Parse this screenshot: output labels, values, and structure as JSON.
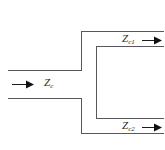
{
  "figure": {
    "background_color": "#ffffff",
    "wall_color": "#58585c",
    "arrow_color": "#111111",
    "label_color": "#2b2b2b"
  },
  "labels": {
    "input_impedance": {
      "symbol": "Z",
      "subscript": "c",
      "full": "Zc",
      "name": "input-characteristic-impedance"
    },
    "output_impedance_top": {
      "symbol": "Z",
      "subscript": "c1",
      "full": "Zc1",
      "name": "upper-branch-characteristic-impedance"
    },
    "output_impedance_bottom": {
      "symbol": "Z",
      "subscript": "c2",
      "full": "Zc2",
      "name": "lower-branch-characteristic-impedance"
    }
  },
  "arrows": [
    {
      "name": "input-propagation-arrow",
      "direction": "right",
      "x1": 12,
      "x2": 34,
      "y": 84
    },
    {
      "name": "upper-output-propagation-arrow",
      "direction": "right",
      "x1": 142,
      "x2": 162,
      "y": 40
    },
    {
      "name": "lower-output-propagation-arrow",
      "direction": "right",
      "x1": 142,
      "x2": 162,
      "y": 127
    }
  ],
  "geometry": {
    "input_guide": {
      "name": "input-waveguide",
      "top_wall_y": 70,
      "bottom_wall_y": 98,
      "left_x": 8,
      "right_x": 81
    },
    "upper_branch": {
      "name": "upper-output-waveguide",
      "top_wall_y": 31,
      "bottom_wall_y": 46,
      "left_x": 81,
      "right_x": 164
    },
    "lower_branch": {
      "name": "lower-output-waveguide",
      "top_wall_y": 118,
      "bottom_wall_y": 133,
      "left_x": 81,
      "right_x": 164
    },
    "cavity_back_wall_x": 96
  }
}
